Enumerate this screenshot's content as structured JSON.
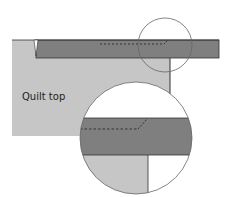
{
  "diagram": {
    "label": "Quilt top",
    "colors": {
      "background": "#ffffff",
      "quilt_top": "#c6c6c6",
      "binding": "#7f7f7f",
      "outline": "#333333",
      "circle_outline": "#666666"
    }
  }
}
